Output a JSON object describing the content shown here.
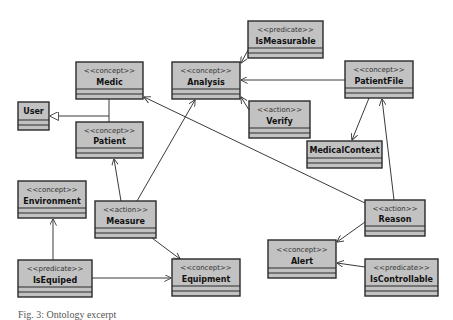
{
  "diagram": {
    "type": "uml-class-diagram",
    "colors": {
      "box_fill": "#c2c2c2",
      "border": "#2a2a2a",
      "edge": "#3a3a3a",
      "background": "#ffffff"
    },
    "nodes": [
      {
        "id": "isMeasurable",
        "stereotype": "<<predicate>>",
        "name": "IsMeasurable",
        "x": 248,
        "y": 21,
        "w": 75,
        "h": 37
      },
      {
        "id": "medic",
        "stereotype": "<<concept>>",
        "name": "Medic",
        "x": 76,
        "y": 62,
        "w": 67,
        "h": 37
      },
      {
        "id": "analysis",
        "stereotype": "<<concept>>",
        "name": "Analysis",
        "x": 172,
        "y": 62,
        "w": 68,
        "h": 37
      },
      {
        "id": "patientFile",
        "stereotype": "<<concept>>",
        "name": "PatientFile",
        "x": 345,
        "y": 61,
        "w": 68,
        "h": 37
      },
      {
        "id": "user",
        "stereotype": "",
        "name": "User",
        "x": 18,
        "y": 102,
        "w": 31,
        "h": 28
      },
      {
        "id": "verify",
        "stereotype": "<<action>>",
        "name": "Verify",
        "x": 249,
        "y": 101,
        "w": 61,
        "h": 37
      },
      {
        "id": "patient",
        "stereotype": "<<concept>>",
        "name": "Patient",
        "x": 76,
        "y": 122,
        "w": 67,
        "h": 36
      },
      {
        "id": "medicalContext",
        "stereotype": "",
        "name": "MedicalContext",
        "x": 307,
        "y": 141,
        "w": 75,
        "h": 27
      },
      {
        "id": "environment",
        "stereotype": "<<concept>>",
        "name": "Environment",
        "x": 18,
        "y": 181,
        "w": 68,
        "h": 37
      },
      {
        "id": "measure",
        "stereotype": "<<action>>",
        "name": "Measure",
        "x": 95,
        "y": 201,
        "w": 61,
        "h": 37
      },
      {
        "id": "reason",
        "stereotype": "<<action>>",
        "name": "Reason",
        "x": 365,
        "y": 200,
        "w": 60,
        "h": 36
      },
      {
        "id": "alert",
        "stereotype": "<<concept>>",
        "name": "Alert",
        "x": 268,
        "y": 240,
        "w": 68,
        "h": 38
      },
      {
        "id": "isEquiped",
        "stereotype": "<<predicate>>",
        "name": "IsEquiped",
        "x": 18,
        "y": 260,
        "w": 74,
        "h": 37
      },
      {
        "id": "equipment",
        "stereotype": "<<concept>>",
        "name": "Equipment",
        "x": 172,
        "y": 259,
        "w": 68,
        "h": 37
      },
      {
        "id": "isControllable",
        "stereotype": "<<predicate>>",
        "name": "IsControllable",
        "x": 365,
        "y": 259,
        "w": 73,
        "h": 37
      }
    ],
    "edges": [
      {
        "from": "medic",
        "to": "user",
        "kind": "generalization"
      },
      {
        "from": "patient",
        "to": "user",
        "kind": "generalization"
      },
      {
        "from": "isMeasurable",
        "to": "analysis",
        "kind": "association"
      },
      {
        "from": "patientFile",
        "to": "analysis",
        "kind": "composition"
      },
      {
        "from": "verify",
        "to": "analysis",
        "kind": "association"
      },
      {
        "from": "patientFile",
        "to": "medicalContext",
        "kind": "composition"
      },
      {
        "from": "reason",
        "to": "patientFile",
        "kind": "association"
      },
      {
        "from": "reason",
        "to": "medic",
        "kind": "association"
      },
      {
        "from": "measure",
        "to": "patient",
        "kind": "association"
      },
      {
        "from": "measure",
        "to": "analysis",
        "kind": "association"
      },
      {
        "from": "measure",
        "to": "equipment",
        "kind": "association"
      },
      {
        "from": "isEquiped",
        "to": "environment",
        "kind": "association"
      },
      {
        "from": "isEquiped",
        "to": "equipment",
        "kind": "association"
      },
      {
        "from": "reason",
        "to": "alert",
        "kind": "association"
      },
      {
        "from": "isControllable",
        "to": "alert",
        "kind": "association"
      }
    ]
  },
  "caption": "Fig. 3: Ontology excerpt"
}
